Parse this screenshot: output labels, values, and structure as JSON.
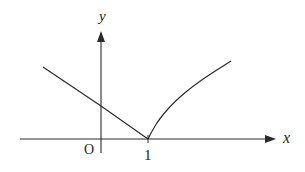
{
  "diagram": {
    "type": "function-graph",
    "colors": {
      "stroke": "#2a2a2a",
      "background": "#ffffff",
      "text": "#222222"
    },
    "axes": {
      "x_label": "x",
      "y_label": "y",
      "origin_label": "O",
      "tick_labels": [
        "1"
      ]
    },
    "pixel_frame": {
      "origin": [
        101,
        139
      ],
      "unit_x": 47,
      "x_axis": {
        "from": [
          20,
          139
        ],
        "to": [
          276,
          139
        ]
      },
      "y_axis": {
        "from": [
          101,
          153
        ],
        "to": [
          101,
          31
        ]
      }
    },
    "pieces": [
      {
        "name": "line-segment",
        "description": "decreasing line from upper-left to (1,0)",
        "from_px": [
          43,
          67
        ],
        "via_px": [
          101,
          106
        ],
        "to_px": [
          148,
          139
        ]
      },
      {
        "name": "concave-curve",
        "description": "increasing concave curve from (1,0) rising to the right",
        "from_px": [
          148,
          139
        ],
        "points_px": [
          [
            152,
            131
          ],
          [
            160,
            118
          ],
          [
            175,
            101
          ],
          [
            198,
            82
          ],
          [
            231,
            61
          ]
        ]
      }
    ],
    "key_point": {
      "label": "1",
      "x": 1,
      "y": 0,
      "px": [
        148,
        139
      ]
    }
  }
}
